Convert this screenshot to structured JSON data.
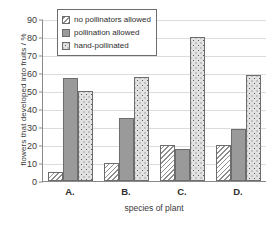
{
  "chart_data": {
    "type": "bar",
    "title": "",
    "subtitle": "",
    "xlabel": "species of plant",
    "ylabel": "flowers that developed into fruits / %",
    "categories": [
      "A.",
      "B.",
      "C.",
      "D."
    ],
    "series": [
      {
        "name": "no pollinators allowed",
        "pattern": "diagonal-hatch",
        "values": [
          5,
          10,
          20,
          20
        ]
      },
      {
        "name": "pollination allowed",
        "pattern": "solid-gray",
        "values": [
          57,
          35,
          18,
          29
        ]
      },
      {
        "name": "hand-pollinated",
        "pattern": "dotted-checker",
        "values": [
          50,
          58,
          80,
          59
        ]
      }
    ],
    "ylim": [
      0,
      90
    ],
    "ytick_step": 10,
    "yticks": [
      0,
      10,
      20,
      30,
      40,
      50,
      60,
      70,
      80,
      90
    ],
    "grid": true,
    "legend_position": "top-left",
    "colors": {
      "hatch_line": "#8e8e8e",
      "solid_fill": "#9a9a9a",
      "dots_fill": "#e2e2e2",
      "dots_dot": "#5c5c5c",
      "bar_border": "#6d6d6d",
      "gridline": "#dcdcdc",
      "axis": "#8a8a8a",
      "text": "#333333",
      "background": "#ffffff"
    }
  }
}
